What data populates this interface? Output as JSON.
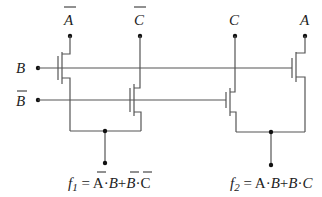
{
  "diagram": {
    "type": "transistor-logic-circuit",
    "inputs": {
      "top": [
        {
          "label": "A",
          "overbar": true,
          "x": 70
        },
        {
          "label": "C",
          "overbar": true,
          "x": 140
        },
        {
          "label": "C",
          "overbar": false,
          "x": 235
        },
        {
          "label": "A",
          "overbar": false,
          "x": 305
        }
      ],
      "left": [
        {
          "label": "B",
          "overbar": false,
          "y": 68
        },
        {
          "label": "B",
          "overbar": true,
          "y": 100
        }
      ]
    },
    "outputs": {
      "f1": {
        "name": "f",
        "subscript": "1",
        "equals": " = ",
        "terms": [
          "A",
          "·",
          "B",
          "+",
          "B",
          "·",
          "C"
        ],
        "text": "f1 = Ā·B + B̄·C̄"
      },
      "f2": {
        "name": "f",
        "subscript": "2",
        "equals": " = ",
        "terms": [
          "A",
          "·",
          "B",
          "+",
          "B",
          "·",
          "C"
        ],
        "text": "f2 = A·B + B·C"
      }
    },
    "colors": {
      "wire": "#555555",
      "node": "#111111",
      "text": "#222222",
      "background": "#ffffff"
    }
  }
}
